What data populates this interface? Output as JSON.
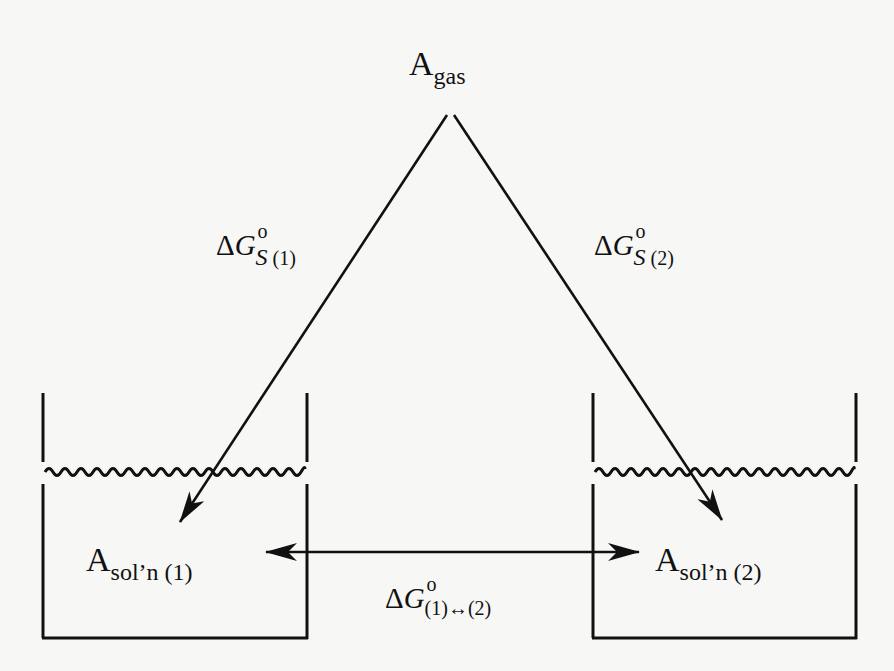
{
  "diagram": {
    "type": "thermodynamic-cycle",
    "nodes": {
      "gas": {
        "base": "A",
        "subscript": "gas"
      },
      "solution1": {
        "base": "A",
        "subscript": "sol’n (1)"
      },
      "solution2": {
        "base": "A",
        "subscript": "sol’n (2)"
      }
    },
    "edges": {
      "solvation1": {
        "delta": "Δ",
        "symbol": "G",
        "superscript": "o",
        "subscript_var": "S",
        "subscript_idx": " (1)"
      },
      "solvation2": {
        "delta": "Δ",
        "symbol": "G",
        "superscript": "o",
        "subscript_var": "S",
        "subscript_idx": " (2)"
      },
      "transfer": {
        "delta": "Δ",
        "symbol": "G",
        "superscript": "o",
        "subscript": "(1)↔(2)"
      }
    },
    "colors": {
      "ink": "#111111",
      "paper": "#f7f7f5"
    }
  }
}
